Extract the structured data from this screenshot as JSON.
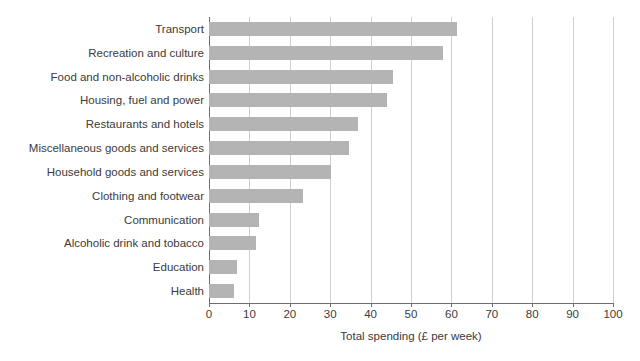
{
  "chart_data": {
    "type": "bar",
    "orientation": "horizontal",
    "title": "",
    "xlabel": "Total spending (£ per week)",
    "ylabel": "",
    "xlim": [
      0,
      100
    ],
    "xticks": [
      0,
      10,
      20,
      30,
      40,
      50,
      60,
      70,
      80,
      90,
      100
    ],
    "xtick_labels": [
      "0",
      "10",
      "20",
      "30",
      "40",
      "50",
      "60",
      "70",
      "80",
      "90",
      "100"
    ],
    "grid": "vertical",
    "legend": "none",
    "bar_color": "#b4b4b4",
    "axis_color": "#6e6e6e",
    "grid_color": "#cfcfcf",
    "text_color": "#3b3b3b",
    "categories": [
      "Transport",
      "Recreation and culture",
      "Food and non-alcoholic drinks",
      "Housing, fuel and power",
      "Restaurants and hotels",
      "Miscellaneous goods and services",
      "Household goods and services",
      "Clothing and footwear",
      "Communication",
      "Alcoholic drink and tobacco",
      "Education",
      "Health"
    ],
    "values": [
      61.5,
      57.9,
      45.5,
      44.0,
      36.9,
      34.7,
      30.2,
      23.3,
      12.4,
      11.6,
      6.9,
      6.2
    ]
  }
}
